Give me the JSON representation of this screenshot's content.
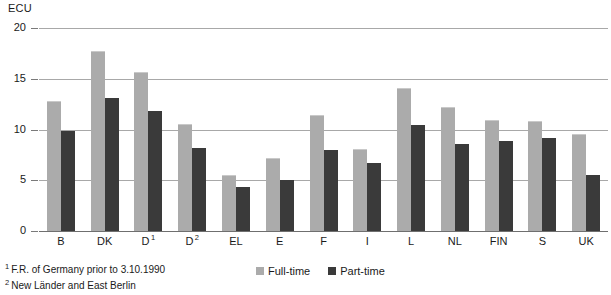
{
  "unit_label": "ECU",
  "footnotes": [
    {
      "marker": "1",
      "text": "F.R. of Germany prior to 3.10.1990"
    },
    {
      "marker": "2",
      "text": "New Länder and East Berlin"
    }
  ],
  "legend": {
    "items": [
      {
        "label": "Full-time",
        "color": "#ababab"
      },
      {
        "label": "Part-time",
        "color": "#3a3a3a"
      }
    ]
  },
  "chart_data": {
    "type": "bar",
    "title": "",
    "xlabel": "",
    "ylabel": "ECU",
    "ylim": [
      0,
      20
    ],
    "yticks": [
      0,
      5,
      10,
      15,
      20
    ],
    "ytick_labels": [
      "0",
      "5",
      "10",
      "15",
      "20"
    ],
    "grid": true,
    "legend_position": "bottom-center",
    "categories": [
      "B",
      "DK",
      "D",
      "D",
      "EL",
      "E",
      "F",
      "I",
      "L",
      "NL",
      "FIN",
      "S",
      "UK"
    ],
    "category_labels": [
      {
        "text": "B",
        "footnote": ""
      },
      {
        "text": "DK",
        "footnote": ""
      },
      {
        "text": "D",
        "footnote": "1"
      },
      {
        "text": "D",
        "footnote": "2"
      },
      {
        "text": "EL",
        "footnote": ""
      },
      {
        "text": "E",
        "footnote": ""
      },
      {
        "text": "F",
        "footnote": ""
      },
      {
        "text": "I",
        "footnote": ""
      },
      {
        "text": "L",
        "footnote": ""
      },
      {
        "text": "NL",
        "footnote": ""
      },
      {
        "text": "FIN",
        "footnote": ""
      },
      {
        "text": "S",
        "footnote": ""
      },
      {
        "text": "UK",
        "footnote": ""
      }
    ],
    "series": [
      {
        "name": "Full-time",
        "color": "#ababab",
        "values": [
          12.8,
          17.7,
          15.7,
          10.5,
          5.5,
          7.2,
          11.4,
          8.1,
          14.1,
          12.2,
          10.9,
          10.8,
          9.6
        ]
      },
      {
        "name": "Part-time",
        "color": "#3a3a3a",
        "values": [
          9.9,
          13.1,
          11.8,
          8.2,
          4.3,
          5.0,
          8.0,
          6.7,
          10.4,
          8.6,
          8.9,
          9.2,
          5.5
        ]
      }
    ]
  }
}
